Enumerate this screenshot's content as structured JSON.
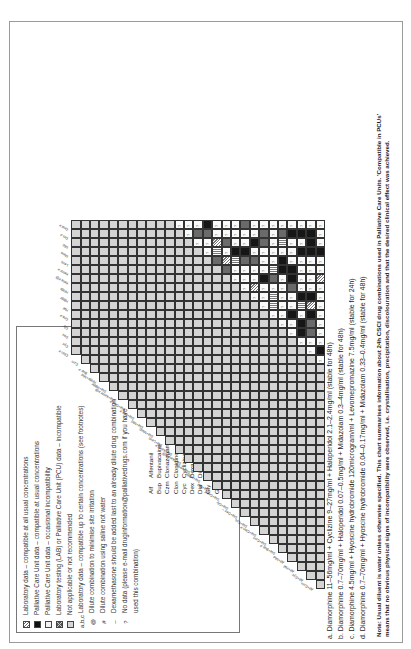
{
  "legend": {
    "items": [
      {
        "swatch": "hatch",
        "text": "Laboratory data – compatible at all usual concentrations"
      },
      {
        "swatch": "black",
        "text": "Palliative Care Unit data – compatible at usual concentrations"
      },
      {
        "swatch": "white",
        "text": "Palliative Care Unit data – occasional incompatibility"
      },
      {
        "swatch": "cross",
        "text": "Laboratory testing (LAB) or Palliative Care Unit (PCU) data – incompatible"
      },
      {
        "swatch": "grey",
        "text": "Not applicable or not recommended"
      },
      {
        "symbol": "a,b,c",
        "text": "Laboratory data – compatible up to certain concentrations (see footnotes)"
      },
      {
        "symbol": "@",
        "text": "Dilute combination to minimise site irritation"
      },
      {
        "symbol": "#",
        "text": "Dilute combination using saline not water"
      },
      {
        "symbol": "–",
        "text": "Dexamethasone should be added last to an already dilute drug combination"
      },
      {
        "symbol": "?",
        "text": "No data (please e-mail druginformation@palliativedrugs.com if you have"
      },
      {
        "symbol": "",
        "text": "used this combination)"
      }
    ],
    "abbreviations_left": [
      {
        "abbr": "Alf",
        "name": "Alfentanil"
      },
      {
        "abbr": "Bup",
        "name": "Bupivacaine"
      },
      {
        "abbr": "Czm",
        "name": "Clonazepam"
      },
      {
        "abbr": "Clon",
        "name": "Clonidine"
      },
      {
        "abbr": "Cyc",
        "name": "Cyclizine"
      },
      {
        "abbr": "Dex",
        "name": "Dexamethasone"
      },
      {
        "abbr": "Dia",
        "name": "Diamorphine"
      },
      {
        "abbr": "Gly",
        "name": "Glycopyrronium"
      },
      {
        "abbr": "Gra",
        "name": "Granisetron"
      },
      {
        "abbr": "Hal",
        "name": "Haloperidol"
      }
    ],
    "abbreviations_right": [
      {
        "abbr": "HBBr",
        "name": "Hyoscine butylbromide"
      },
      {
        "abbr": "HHBr",
        "name": "Hyoscine hydrobromide"
      },
      {
        "abbr": "Keta",
        "name": "Ketamine"
      },
      {
        "abbr": "Ketor",
        "name": "Ketorolac"
      },
      {
        "abbr": "Levo",
        "name": "Levomepromazine"
      },
      {
        "abbr": "",
        "name": "(methotrimeprazine)"
      },
      {
        "abbr": "Meto",
        "name": "Metoclopramide"
      },
      {
        "abbr": "Mid",
        "name": "Midazolam"
      },
      {
        "abbr": "Oct",
        "name": "Octreotide"
      },
      {
        "abbr": "Ond",
        "name": "Ondansetron"
      }
    ]
  },
  "chart": {
    "column_labels_left": [
      "Alf+Czm",
      "Alf+Cyc",
      "Alf+Hal",
      "Alf+Mid",
      "Dia+Bup #",
      "Dia+Czm",
      "Dia+Clon #",
      "Dia+Cyc",
      "Dia+Dex –",
      "Dia+Gly",
      "Dia+Gra #",
      "Dia+Hal",
      "Dia+HBBr",
      "Dia+HHBr",
      "Dia+Keta #@",
      "Dia+Ketor #",
      "Dia+Levo",
      "Dia+Meto",
      "Dia+Mid",
      "Dia+Oct #",
      "Dia+Ond #",
      "Dia+Ketor #@",
      "Dia+HBBr",
      "HHBr+Mid",
      "Bup #"
    ],
    "column_labels_right": [
      "Czm",
      "Clon #",
      "Cyc",
      "Dex",
      "Gly",
      "Gra #",
      "Hal",
      "HBBr",
      "HHBr",
      "Keta #@",
      "Ketor #",
      "Levo",
      "Meto",
      "Mid",
      "Oct #",
      "Ond #"
    ]
  },
  "footnotes": [
    "a. Diamorphine 11–56mg/ml + Cyclizine 9–27mg/ml + Haloperidol 2.1–2.4mg/ml (stable for 48h)",
    "b. Diamorphine 0.7–70mg/ml + Haloperidol 0.07–0.5mg/ml + Midazolam 0.3–4mg/ml (stable for 48h)",
    "c. Diamorphine 4.5mg/ml + Hyoscine hydrobromide 120microgram/ml + Levomepromazine 7.5mg/ml (stable for 24h)",
    "d. Diamorphine 0.7–70mg/ml + Hyoscine hydrobromide 0.04–0.17mg/ml + Midazolam 0.33–0.4mg/ml (stable for 48h)"
  ],
  "note": {
    "line1": "Note: Usual diluent is water unless otherwise specified. This chart summarises information about 24h CSCI drug combinations used in Palliative Care Units. 'Compatible in PCUs'",
    "line2": "means that no obvious physical signs of incompatibility were observed, i.e. crystallisation, precipitation, discolouration and that the desired clinical effect was achieved."
  }
}
